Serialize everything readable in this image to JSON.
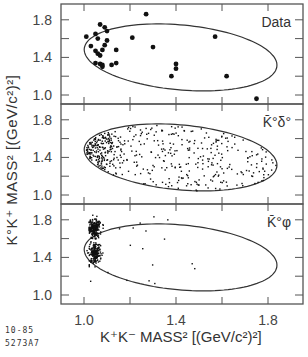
{
  "figure": {
    "y_axis_label": "K°K⁺ MASS² [(GeV/c²)²]",
    "x_axis_label": "K⁺K⁻ MASS²  [(GeV/c²)²]",
    "figure_id_line1": "10-85",
    "figure_id_line2": "5273A7"
  },
  "chart_data": [
    {
      "type": "scatter",
      "title": "",
      "panel_label": "Data",
      "xlabel": "K⁺K⁻ MASS² [(GeV/c²)²]",
      "ylabel": "K°K⁺ MASS² [(GeV/c²)²]",
      "xlim": [
        0.9,
        1.95
      ],
      "ylim": [
        0.88,
        1.98
      ],
      "x_ticks": [
        1.0,
        1.4,
        1.8
      ],
      "y_ticks": [
        1.0,
        1.4,
        1.8
      ],
      "marker": "large-dot",
      "boundary": "Dalitz-plot kinematic boundary",
      "points": [
        [
          1.01,
          1.62
        ],
        [
          1.03,
          1.52
        ],
        [
          1.05,
          1.65
        ],
        [
          1.06,
          1.6
        ],
        [
          1.07,
          1.75
        ],
        [
          1.09,
          1.72
        ],
        [
          1.1,
          1.68
        ],
        [
          1.1,
          1.58
        ],
        [
          1.08,
          1.48
        ],
        [
          1.05,
          1.47
        ],
        [
          1.06,
          1.44
        ],
        [
          1.07,
          1.42
        ],
        [
          1.09,
          1.53
        ],
        [
          1.05,
          1.34
        ],
        [
          1.07,
          1.33
        ],
        [
          1.08,
          1.32
        ],
        [
          1.08,
          1.3
        ],
        [
          1.12,
          1.32
        ],
        [
          1.14,
          1.34
        ],
        [
          1.14,
          1.48
        ],
        [
          1.21,
          1.61
        ],
        [
          1.27,
          1.86
        ],
        [
          1.3,
          1.51
        ],
        [
          1.4,
          1.33
        ],
        [
          1.4,
          1.28
        ],
        [
          1.38,
          1.2
        ],
        [
          1.57,
          1.62
        ],
        [
          1.62,
          1.2
        ],
        [
          1.75,
          0.96
        ]
      ]
    },
    {
      "type": "scatter",
      "panel_label": "K̄°δ°",
      "xlim": [
        0.9,
        1.95
      ],
      "ylim": [
        0.88,
        1.98
      ],
      "x_ticks": [
        1.0,
        1.4,
        1.8
      ],
      "y_ticks": [
        1.0,
        1.4,
        1.8
      ],
      "marker": "small-dot",
      "description": "Monte Carlo K̄°δ° events: dense band near K⁺K⁻ mass² ≈ 1.0–1.1 spread uniformly in K°K⁺ mass², thinning toward higher K⁺K⁻ mass²",
      "approx_point_count": 500
    },
    {
      "type": "scatter",
      "panel_label": "K̄°φ",
      "xlim": [
        0.9,
        1.95
      ],
      "ylim": [
        0.88,
        1.98
      ],
      "x_ticks": [
        1.0,
        1.4,
        1.8
      ],
      "y_ticks": [
        1.0,
        1.4,
        1.8
      ],
      "marker": "small-dot",
      "description": "Monte Carlo K̄°φ events: narrow vertical band at K⁺K⁻ mass² ≈ 1.04 concentrated at both ends (≈1.72 and ≈1.45) of the boundary, few scattered points",
      "approx_point_count": 450
    }
  ]
}
